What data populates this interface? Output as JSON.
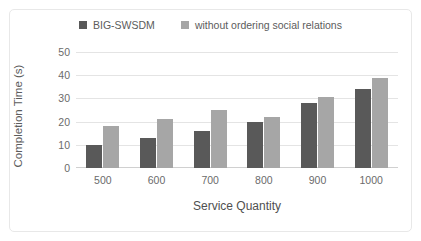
{
  "chart_data": {
    "type": "bar",
    "title": "",
    "categories": [
      "500",
      "600",
      "700",
      "800",
      "900",
      "1000"
    ],
    "series": [
      {
        "name": "BIG-SWSDM",
        "color": "#595959",
        "values": [
          10,
          13,
          16,
          20,
          28,
          34
        ]
      },
      {
        "name": "without ordering social relations",
        "color": "#a6a6a6",
        "values": [
          18,
          21,
          25,
          22,
          30.5,
          39
        ]
      }
    ],
    "xlabel": "Service Quantity",
    "ylabel": "Completion Time (s)",
    "ylim": [
      0,
      50
    ],
    "yticks": [
      0,
      10,
      20,
      30,
      40,
      50
    ],
    "ytick_labels": [
      "0",
      "10",
      "20",
      "30",
      "40",
      "50"
    ],
    "grid": true,
    "legend_position": "top-center"
  },
  "colors": {
    "series_1": "#595959",
    "series_2": "#a6a6a6",
    "gridline": "#e4e4e4",
    "axis_text": "#6b6b6b",
    "frame": "#e8e8e8",
    "background": "#ffffff"
  }
}
